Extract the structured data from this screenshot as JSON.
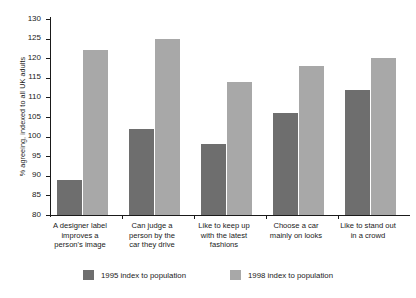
{
  "chart_data": {
    "type": "bar",
    "title": "",
    "subtitle": "",
    "xlabel": "",
    "ylabel": "% agreeing, indexed to all UK adults",
    "ylim": [
      80,
      130
    ],
    "ytick_step": 5,
    "yticks": [
      130,
      125,
      120,
      115,
      110,
      105,
      100,
      95,
      90,
      85,
      80
    ],
    "grid": false,
    "legend_position": "bottom",
    "categories": [
      "A designer label improves a person's image",
      "Can judge a person by the car they drive",
      "Like to keep up with the latest fashions",
      "Choose a car mainly on looks",
      "Like to stand out in a crowd"
    ],
    "category_lines": [
      [
        "A designer label",
        "improves a",
        "person's image"
      ],
      [
        "Can judge a",
        "person by the",
        "car they drive"
      ],
      [
        "Like to keep up",
        "with the latest",
        "fashions"
      ],
      [
        "Choose a car",
        "mainly on looks"
      ],
      [
        "Like to stand out",
        "in a crowd"
      ]
    ],
    "series": [
      {
        "name": "1995 index to population",
        "color": "#6e6e6e",
        "values": [
          89,
          102,
          98,
          106,
          112
        ]
      },
      {
        "name": "1998 index to population",
        "color": "#a8a8a8",
        "values": [
          122,
          125,
          114,
          118,
          120
        ]
      }
    ]
  }
}
